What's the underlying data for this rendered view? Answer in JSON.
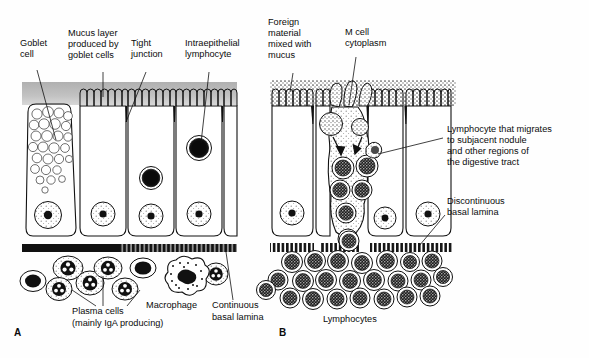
{
  "figure": {
    "background_color": "#fefefe",
    "ink_color": "#111111",
    "mucus_color": "#b8b8b8",
    "width": 589,
    "height": 358
  },
  "panels": [
    {
      "id": "A",
      "letter": "A",
      "letter_pos": {
        "x": 14,
        "y": 336
      },
      "description": "Ordinary absorptive intestinal epithelium with goblet cell, continuous basal lamina and lamina propria containing plasma cells and a macrophage."
    },
    {
      "id": "B",
      "letter": "B",
      "letter_pos": {
        "x": 279,
        "y": 336
      },
      "description": "Follicle-associated epithelium with M cell transporting foreign material to lymphocytes over a discontinuous basal lamina."
    }
  ],
  "labels": {
    "goblet_cell": {
      "lines": [
        "Goblet",
        "cell"
      ],
      "x": 20,
      "y": 46,
      "anchor": "start"
    },
    "mucus_layer": {
      "lines": [
        "Mucus layer",
        "produced by",
        "goblet cells"
      ],
      "x": 68,
      "y": 36,
      "anchor": "start"
    },
    "tight_junction": {
      "lines": [
        "Tight",
        "junction"
      ],
      "x": 131,
      "y": 46,
      "anchor": "start"
    },
    "intraepithelial_lymphocyte": {
      "lines": [
        "Intraepithelial",
        "lymphocyte"
      ],
      "x": 185,
      "y": 46,
      "anchor": "start"
    },
    "foreign_material": {
      "lines": [
        "Foreign",
        "material",
        "mixed with",
        "mucus"
      ],
      "x": 268,
      "y": 25,
      "anchor": "start"
    },
    "m_cell_cytoplasm": {
      "lines": [
        "M cell",
        "cytoplasm"
      ],
      "x": 345,
      "y": 35,
      "anchor": "start"
    },
    "migrating_lymphocyte": {
      "lines": [
        "Lymphocyte that migrates",
        "to subjacent nodule",
        "and other regions of",
        "the digestive tract"
      ],
      "x": 447,
      "y": 132,
      "anchor": "start"
    },
    "discontinuous_basal_lamina": {
      "lines": [
        "Discontinuous",
        "basal lamina"
      ],
      "x": 447,
      "y": 204,
      "anchor": "start"
    },
    "plasma_cells": {
      "lines": [
        "Plasma cells",
        "(mainly IgA producing)"
      ],
      "x": 72,
      "y": 314,
      "anchor": "start"
    },
    "macrophage": {
      "lines": [
        "Macrophage"
      ],
      "x": 146,
      "y": 308,
      "anchor": "start"
    },
    "continuous_basal_lamina": {
      "lines": [
        "Continuous",
        "basal lamina"
      ],
      "x": 212,
      "y": 308,
      "anchor": "start"
    },
    "lymphocytes": {
      "lines": [
        "Lymphocytes"
      ],
      "x": 323,
      "y": 322,
      "anchor": "start"
    }
  },
  "structures": {
    "panel_a": {
      "mucus_band": {
        "x": 22,
        "y": 82,
        "w": 215,
        "h": 22,
        "fill": "#b9b9b9"
      },
      "goblet_cell": {
        "x": 26,
        "y": 104,
        "w": 46,
        "h": 132,
        "vacuole_count": 26
      },
      "enterocyte_columns": 4,
      "intraepithelial_lymphocytes": 2,
      "basal_lamina": {
        "type": "continuous",
        "x": 22,
        "y": 244,
        "w": 215,
        "h": 8
      },
      "lamina_propria_cells": {
        "plasma_cells": 8,
        "macrophages": 1
      }
    },
    "panel_b": {
      "mucus_band": {
        "x": 270,
        "y": 80,
        "w": 185,
        "h": 26,
        "fill": "stipple"
      },
      "m_cell": {
        "pocket_lymphocytes": 6,
        "engulfed_particles": 2
      },
      "enterocyte_columns": 4,
      "basal_lamina": {
        "type": "discontinuous",
        "segments": 3,
        "x": 270,
        "y": 244
      },
      "lymphocyte_cluster_count": 26
    }
  }
}
